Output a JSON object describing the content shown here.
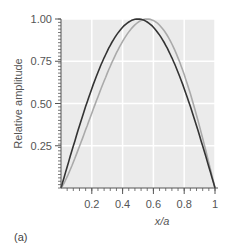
{
  "chart_data": {
    "type": "line",
    "title": "",
    "xlabel": "x/a",
    "ylabel": "Relative amplitude",
    "xlim": [
      0,
      1
    ],
    "ylim": [
      0,
      1
    ],
    "xticks": [
      0.2,
      0.4,
      0.6,
      0.8,
      1
    ],
    "xtick_labels": [
      "0.2",
      "0.4",
      "0.6",
      "0.8",
      "1"
    ],
    "yticks": [
      0.25,
      0.5,
      0.75,
      1.0
    ],
    "ytick_labels": [
      "0.25",
      "0.50",
      "0.75",
      "1.00"
    ],
    "grid": true,
    "legend": null,
    "panel_label": "(a)",
    "series": [
      {
        "name": "dark curve (symmetric)",
        "color": "#333333",
        "x": [
          0,
          0.1,
          0.2,
          0.3,
          0.4,
          0.5,
          0.6,
          0.7,
          0.8,
          0.9,
          1.0
        ],
        "y": [
          0,
          0.31,
          0.59,
          0.81,
          0.95,
          1.0,
          0.95,
          0.81,
          0.59,
          0.31,
          0
        ]
      },
      {
        "name": "light curve (skewed)",
        "color": "#aaaaaa",
        "x": [
          0,
          0.1,
          0.2,
          0.3,
          0.4,
          0.5,
          0.56,
          0.6,
          0.7,
          0.8,
          0.9,
          1.0
        ],
        "y": [
          0,
          0.26,
          0.5,
          0.71,
          0.88,
          0.98,
          1.0,
          0.99,
          0.9,
          0.69,
          0.38,
          0
        ]
      }
    ]
  },
  "colors": {
    "panel_bg": "#ebebeb",
    "grid": "#ffffff",
    "axis": "#555555"
  }
}
